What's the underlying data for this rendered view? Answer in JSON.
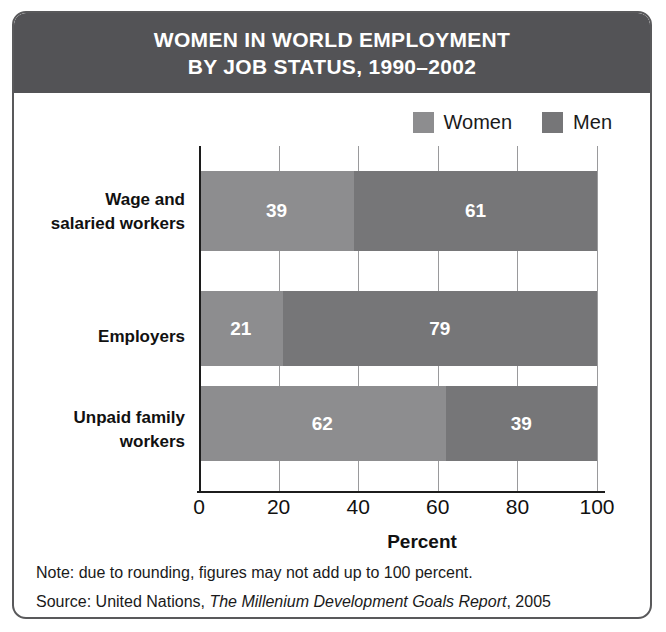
{
  "title": {
    "line1": "WOMEN IN WORLD EMPLOYMENT",
    "line2": "BY JOB STATUS, 1990–2002"
  },
  "legend": {
    "items": [
      {
        "label": "Women",
        "color": "#8d8d8f",
        "swatch_name": "legend-swatch-women"
      },
      {
        "label": "Men",
        "color": "#767678",
        "swatch_name": "legend-swatch-men"
      }
    ]
  },
  "footnotes": {
    "note": "Note: due to rounding, figures may not add up to 100 percent.",
    "source_prefix": "Source: United Nations, ",
    "source_title": "The Millenium Development Goals Report",
    "source_suffix": ", 2005"
  },
  "colors": {
    "banner": "#535356",
    "frame": "#59595b",
    "women": "#8d8d8f",
    "men": "#767678",
    "axis": "#1c1c1c",
    "grid": "#9a9a9c",
    "value_text": "#ffffff"
  },
  "chart_data": {
    "type": "bar",
    "orientation": "horizontal",
    "stacked": true,
    "title": "WOMEN IN WORLD EMPLOYMENT BY JOB STATUS, 1990–2002",
    "subtitle": "",
    "xlabel": "Percent",
    "ylabel": "",
    "xlim": [
      0,
      100
    ],
    "xticks": [
      0,
      20,
      40,
      60,
      80,
      100
    ],
    "xticklabels": [
      "0",
      "20",
      "40",
      "60",
      "80",
      "100"
    ],
    "grid": true,
    "legend_position": "top-right",
    "categories": [
      {
        "label_line1": "Wage and",
        "label_line2": "salaried workers"
      },
      {
        "label_line1": "Employers",
        "label_line2": ""
      },
      {
        "label_line1": "Unpaid family",
        "label_line2": "workers"
      }
    ],
    "series": [
      {
        "name": "Women",
        "color": "#8d8d8f",
        "values": [
          39,
          21,
          62
        ]
      },
      {
        "name": "Men",
        "color": "#767678",
        "values": [
          61,
          79,
          39
        ]
      }
    ],
    "annotations": [
      "Note: due to rounding, figures may not add up to 100 percent."
    ]
  }
}
